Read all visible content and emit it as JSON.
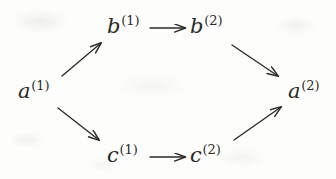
{
  "figure": {
    "kind": "commutative-diagram",
    "shape": "diamond",
    "ink_color": "#2b2a28",
    "background_color": "#fdfdfc"
  },
  "nodes": [
    {
      "id": "a1",
      "base": "a",
      "superscript": "(1)",
      "x": 18,
      "y": 79
    },
    {
      "id": "b1",
      "base": "b",
      "superscript": "(1)",
      "x": 107,
      "y": 14
    },
    {
      "id": "b2",
      "base": "b",
      "superscript": "(2)",
      "x": 190,
      "y": 14
    },
    {
      "id": "c1",
      "base": "c",
      "superscript": "(1)",
      "x": 107,
      "y": 143
    },
    {
      "id": "c2",
      "base": "c",
      "superscript": "(2)",
      "x": 190,
      "y": 143
    },
    {
      "id": "a2",
      "base": "a",
      "superscript": "(2)",
      "x": 288,
      "y": 79
    }
  ],
  "arrows": [
    {
      "id": "a1-to-b1",
      "from": "a1",
      "to": "b1",
      "style": "diagonal-up-right",
      "x1": 62,
      "y1": 76,
      "x2": 101,
      "y2": 43
    },
    {
      "id": "a1-to-c1",
      "from": "a1",
      "to": "c1",
      "style": "diagonal-down-right",
      "x1": 58,
      "y1": 108,
      "x2": 99,
      "y2": 140
    },
    {
      "id": "b1-to-b2",
      "from": "b1",
      "to": "b2",
      "style": "horizontal-right",
      "x1": 150,
      "y1": 28,
      "x2": 185,
      "y2": 28
    },
    {
      "id": "c1-to-c2",
      "from": "c1",
      "to": "c2",
      "style": "horizontal-right",
      "x1": 150,
      "y1": 157,
      "x2": 185,
      "y2": 157
    },
    {
      "id": "b2-to-a2",
      "from": "b2",
      "to": "a2",
      "style": "diagonal-down-right",
      "x1": 232,
      "y1": 45,
      "x2": 278,
      "y2": 76
    },
    {
      "id": "c2-to-a2",
      "from": "c2",
      "to": "a2",
      "style": "diagonal-up-right",
      "x1": 234,
      "y1": 140,
      "x2": 281,
      "y2": 107
    }
  ]
}
